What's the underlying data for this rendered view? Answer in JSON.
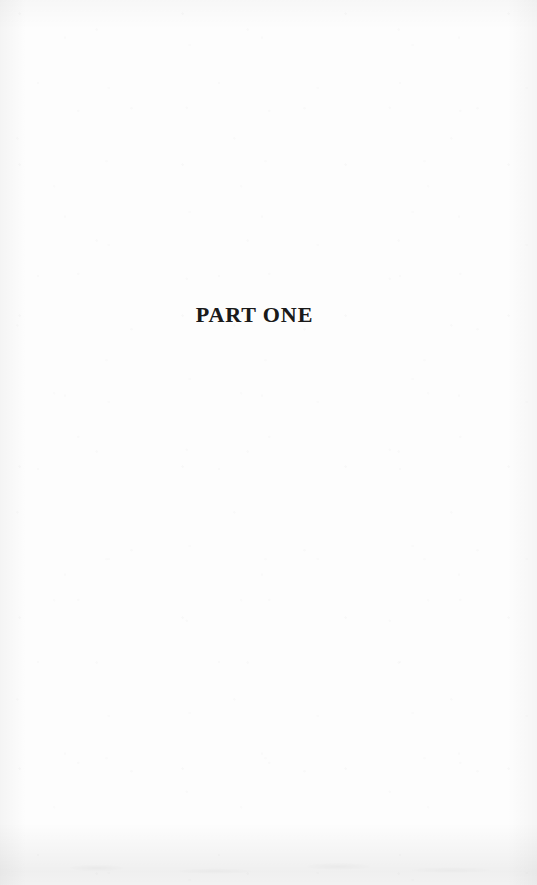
{
  "page": {
    "kind": "book-part-divider-page",
    "background_color": "#fdfdfd",
    "ink_color": "#1a1a1a"
  },
  "content": {
    "part_title": "PART ONE"
  }
}
